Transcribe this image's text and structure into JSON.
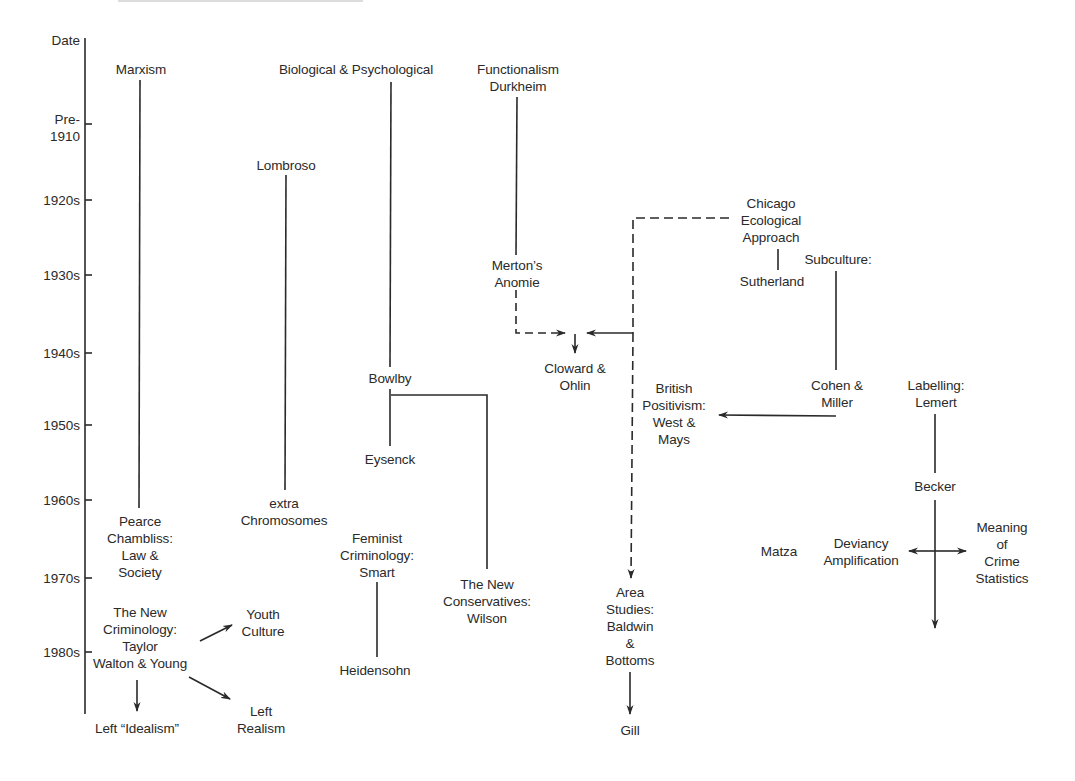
{
  "diagram": {
    "type": "timeline-flow",
    "axis": {
      "title": "Date",
      "ticks": [
        {
          "label": "Pre-\n1910",
          "y": 124
        },
        {
          "label": "1920s",
          "y": 200
        },
        {
          "label": "1930s",
          "y": 275
        },
        {
          "label": "1940s",
          "y": 353
        },
        {
          "label": "1950s",
          "y": 425
        },
        {
          "label": "1960s",
          "y": 500
        },
        {
          "label": "1970s",
          "y": 578
        },
        {
          "label": "1980s",
          "y": 652
        }
      ]
    },
    "nodes": {
      "marxism": "Marxism",
      "pearce": "Pearce\nChambliss:\nLaw &\nSociety",
      "new_criminology": "The New\nCriminology:\nTaylor\nWalton & Young",
      "youth_culture": "Youth\nCulture",
      "left_idealism": "Left “Idealism”",
      "left_realism": "Left\nRealism",
      "biological": "Biological & Psychological",
      "lombroso": "Lombroso",
      "extra_chromosomes": "extra\nChromosomes",
      "bowlby": "Bowlby",
      "eysenck": "Eysenck",
      "feminist": "Feminist\nCriminology:\nSmart",
      "heidensohn": "Heidensohn",
      "new_conservatives": "The New\nConservatives:\nWilson",
      "functionalism": "Functionalism\nDurkheim",
      "merton": "Merton’s\nAnomie",
      "cloward": "Cloward &\nOhlin",
      "area_studies": "Area\nStudies:\nBaldwin\n&\nBottoms",
      "gill": "Gill",
      "chicago": "Chicago\nEcological\nApproach",
      "sutherland": "Sutherland",
      "subculture": "Subculture:",
      "cohen_miller": "Cohen &\nMiller",
      "british_positivism": "British\nPositivism:\nWest &\nMays",
      "labelling": "Labelling:\nLemert",
      "becker": "Becker",
      "matza": "Matza",
      "deviancy": "Deviancy\nAmplification",
      "meaning": "Meaning\nof\nCrime\nStatistics"
    },
    "edges": [
      {
        "from": "marxism",
        "to": "pearce",
        "style": "solid"
      },
      {
        "from": "new_criminology",
        "to": "youth_culture",
        "style": "arrow"
      },
      {
        "from": "new_criminology",
        "to": "left_idealism",
        "style": "arrow"
      },
      {
        "from": "new_criminology",
        "to": "left_realism",
        "style": "arrow"
      },
      {
        "from": "lombroso",
        "to": "extra_chromosomes",
        "style": "solid"
      },
      {
        "from": "biological",
        "to": "bowlby",
        "style": "solid"
      },
      {
        "from": "bowlby",
        "to": "eysenck",
        "style": "solid"
      },
      {
        "from": "bowlby",
        "to": "new_conservatives",
        "style": "solid"
      },
      {
        "from": "feminist",
        "to": "heidensohn",
        "style": "solid"
      },
      {
        "from": "functionalism",
        "to": "merton",
        "style": "solid"
      },
      {
        "from": "merton",
        "to": "cloward",
        "style": "dashed-arrow"
      },
      {
        "from": "chicago",
        "to": "cloward",
        "style": "dashed-arrow"
      },
      {
        "from": "chicago",
        "to": "area_studies",
        "style": "dashed-arrow"
      },
      {
        "from": "area_studies",
        "to": "gill",
        "style": "arrow"
      },
      {
        "from": "chicago",
        "to": "sutherland",
        "style": "solid"
      },
      {
        "from": "subculture",
        "to": "cohen_miller",
        "style": "solid"
      },
      {
        "from": "cohen_miller",
        "to": "british_positivism",
        "style": "arrow"
      },
      {
        "from": "labelling",
        "to": "becker",
        "style": "solid"
      },
      {
        "from": "becker",
        "to": "deviancy",
        "style": "arrow"
      },
      {
        "from": "becker",
        "to": "meaning",
        "style": "arrow"
      }
    ]
  },
  "colors": {
    "ink": "#2a2a2a",
    "background": "#ffffff"
  }
}
